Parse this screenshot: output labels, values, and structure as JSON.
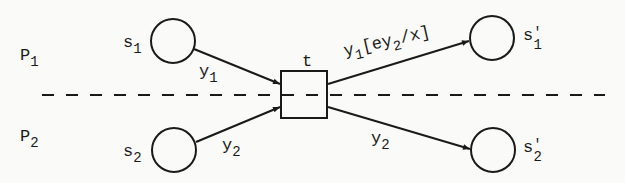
{
  "diagram": {
    "type": "petri-net",
    "partitions": [
      {
        "id": "P1",
        "label": "P",
        "sub": "1"
      },
      {
        "id": "P2",
        "label": "P",
        "sub": "2"
      }
    ],
    "places": [
      {
        "id": "s1",
        "label": "s",
        "sub": "1",
        "prime": ""
      },
      {
        "id": "s2",
        "label": "s",
        "sub": "2",
        "prime": ""
      },
      {
        "id": "s1p",
        "label": "s",
        "sub": "1",
        "prime": "'"
      },
      {
        "id": "s2p",
        "label": "s",
        "sub": "2",
        "prime": "'"
      }
    ],
    "transition": {
      "id": "t",
      "label": "t"
    },
    "arcs": [
      {
        "from": "s1",
        "to": "t",
        "label": "y",
        "sub": "1",
        "suffix_pre": "",
        "sub2": "",
        "suffix_post": ""
      },
      {
        "from": "s2",
        "to": "t",
        "label": "y",
        "sub": "2",
        "suffix_pre": "",
        "sub2": "",
        "suffix_post": ""
      },
      {
        "from": "t",
        "to": "s1p",
        "label": "y",
        "sub": "1",
        "suffix_pre": "[ey",
        "sub2": "2",
        "suffix_post": "/x]"
      },
      {
        "from": "t",
        "to": "s2p",
        "label": "y",
        "sub": "2",
        "suffix_pre": "",
        "sub2": "",
        "suffix_post": ""
      }
    ],
    "colors": {
      "stroke": "#1a1a1a",
      "background": "#fafaf8"
    }
  }
}
